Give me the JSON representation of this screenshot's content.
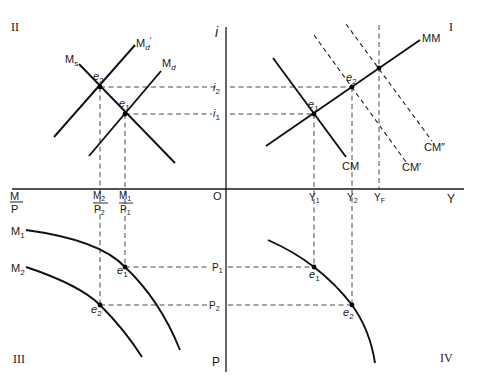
{
  "quadrants": {
    "q1": "I",
    "q2": "II",
    "q3": "III",
    "q4": "IV"
  },
  "axes": {
    "vertical_top": "i",
    "vertical_bottom": "P",
    "horizontal_right": "Y",
    "horizontal_left_num": "M",
    "horizontal_left_den": "P",
    "origin": "O"
  },
  "quadrant2": {
    "curves": {
      "ms": "M",
      "ms_sub": "s",
      "md_prime": "M",
      "md_prime_sub": "d",
      "md_prime_mark": "′",
      "md": "M",
      "md_sub": "d"
    },
    "points": {
      "e2": "e",
      "e2_sub": "2",
      "e1": "e",
      "e1_sub": "1"
    },
    "ticks": {
      "m2p2_num": "M",
      "m2p2_num_sub": "2",
      "m2p2_den": "P",
      "m2p2_den_sub": "2",
      "m1p1_num": "M",
      "m1p1_num_sub": "1",
      "m1p1_den": "P",
      "m1p1_den_sub": "1"
    }
  },
  "vertical_ticks": {
    "i2": "i",
    "i2_sub": "2",
    "i1": "i",
    "i1_sub": "1",
    "p1": "P",
    "p1_sub": "1",
    "p2": "P",
    "p2_sub": "2"
  },
  "quadrant1": {
    "curves": {
      "mm": "MM",
      "cm": "CM",
      "cm_prime": "CM′",
      "cm_dprime": "CM″"
    },
    "points": {
      "e1": "e",
      "e1_sub": "1",
      "e2": "e",
      "e2_sub": "2"
    },
    "ticks": {
      "y1": "Y",
      "y1_sub": "1",
      "y2": "Y",
      "y2_sub": "2",
      "yf": "Y",
      "yf_sub": "F"
    }
  },
  "quadrant3": {
    "curves": {
      "m1": "M",
      "m1_sub": "1",
      "m2": "M",
      "m2_sub": "2"
    },
    "points": {
      "e1": "e",
      "e1_sub": "1",
      "e2": "e",
      "e2_sub": "2"
    }
  },
  "quadrant4": {
    "points": {
      "e1": "e",
      "e1_sub": "1",
      "e2": "e",
      "e2_sub": "2"
    }
  }
}
